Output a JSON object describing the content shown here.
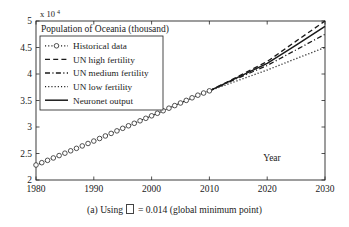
{
  "figure": {
    "caption_prefix": "(a) Using",
    "caption_symbol": "missing-glyph-box",
    "caption_suffix": "= 0.014 (global minimum point)"
  },
  "chart_data": {
    "type": "line",
    "title": "Population of Oceania (thousand)",
    "xlabel": "Year",
    "ylabel": "",
    "y_exponent_label": "x 10",
    "y_exponent_power": "4",
    "xlim": [
      1980,
      2030
    ],
    "ylim": [
      2,
      5
    ],
    "xticks": [
      1980,
      1990,
      2000,
      2010,
      2020,
      2030
    ],
    "xticklabels": [
      "1980",
      "1990",
      "2000",
      "2010",
      "2020",
      "2030"
    ],
    "yticks": [
      2,
      2.5,
      3,
      3.5,
      4,
      4.5,
      5
    ],
    "yticklabels": [
      "2",
      "2.5",
      "3",
      "3.5",
      "4",
      "4.5",
      "5"
    ],
    "grid": false,
    "legend_position": "upper left",
    "series": [
      {
        "name": "Historical data",
        "style": "marker-circle",
        "x": [
          1980,
          1981,
          1982,
          1983,
          1984,
          1985,
          1986,
          1987,
          1988,
          1989,
          1990,
          1991,
          1992,
          1993,
          1994,
          1995,
          1996,
          1997,
          1998,
          1999,
          2000,
          2001,
          2002,
          2003,
          2004,
          2005,
          2006,
          2007,
          2008,
          2009,
          2010
        ],
        "values": [
          2.283,
          2.327,
          2.371,
          2.416,
          2.461,
          2.506,
          2.551,
          2.597,
          2.643,
          2.689,
          2.735,
          2.783,
          2.831,
          2.879,
          2.927,
          2.975,
          3.023,
          3.07,
          3.117,
          3.164,
          3.211,
          3.259,
          3.307,
          3.355,
          3.404,
          3.453,
          3.502,
          3.551,
          3.6,
          3.641,
          3.682
        ]
      },
      {
        "name": "UN high fertility",
        "style": "dashed",
        "x": [
          2010,
          2015,
          2020,
          2025,
          2030
        ],
        "values": [
          3.682,
          3.955,
          4.235,
          4.62,
          5.0
        ]
      },
      {
        "name": "UN medium fertility",
        "style": "dash-dot",
        "x": [
          2010,
          2015,
          2020,
          2025,
          2030
        ],
        "values": [
          3.682,
          3.925,
          4.16,
          4.455,
          4.75
        ]
      },
      {
        "name": "UN low fertility",
        "style": "dotted",
        "x": [
          2010,
          2015,
          2020,
          2025,
          2030
        ],
        "values": [
          3.682,
          3.88,
          4.075,
          4.29,
          4.5
        ]
      },
      {
        "name": "Neuronet output",
        "style": "solid",
        "x": [
          2010,
          2015,
          2020,
          2025,
          2030
        ],
        "values": [
          3.682,
          3.94,
          4.2,
          4.545,
          4.9
        ]
      }
    ],
    "legend": [
      {
        "label": "Historical data",
        "style": "marker-circle"
      },
      {
        "label": "UN high fertility",
        "style": "dashed"
      },
      {
        "label": "UN medium fertility",
        "style": "dash-dot"
      },
      {
        "label": "UN low fertility",
        "style": "dotted"
      },
      {
        "label": "Neuronet output",
        "style": "solid"
      }
    ]
  }
}
